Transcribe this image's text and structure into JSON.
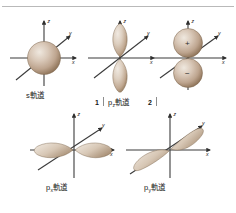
{
  "figure": {
    "title_domain": "atomic-orbital-shapes",
    "background_color": "#ffffff",
    "rule_color": "#b9b9b9",
    "lobe_color_light": "#e6ddd2",
    "lobe_color_mid": "#c3ac9a",
    "lobe_color_dark": "#8f7560",
    "axis_color": "#3b3b3b",
    "text_color": "#1d1d1d"
  },
  "axes": {
    "z_label": "z",
    "y_label": "y",
    "x_label": "x"
  },
  "panels": [
    {
      "id": "s-orbital",
      "caption": "s軌道",
      "caption_base": "s",
      "caption_sub": "",
      "caption_suffix": "軌道",
      "shape": "sphere"
    },
    {
      "id": "pz-orbital",
      "caption": "p z 軌道",
      "caption_base": "p",
      "caption_sub": "z",
      "caption_suffix": "軌道",
      "shape": "dumbbell-vertical",
      "mark_left": "1",
      "mark_right": "2"
    },
    {
      "id": "pz-orbital-signed",
      "caption": "",
      "caption_base": "",
      "caption_sub": "",
      "caption_suffix": "",
      "shape": "two-spheres-signed",
      "sign_top": "+",
      "sign_bottom": "−"
    },
    {
      "id": "px-orbital",
      "caption": "p x 軌道",
      "caption_base": "p",
      "caption_sub": "x",
      "caption_suffix": "軌道",
      "shape": "dumbbell-x"
    },
    {
      "id": "py-orbital",
      "caption": "p y 軌道",
      "caption_base": "p",
      "caption_sub": "y",
      "caption_suffix": "軌道",
      "shape": "dumbbell-y"
    }
  ]
}
